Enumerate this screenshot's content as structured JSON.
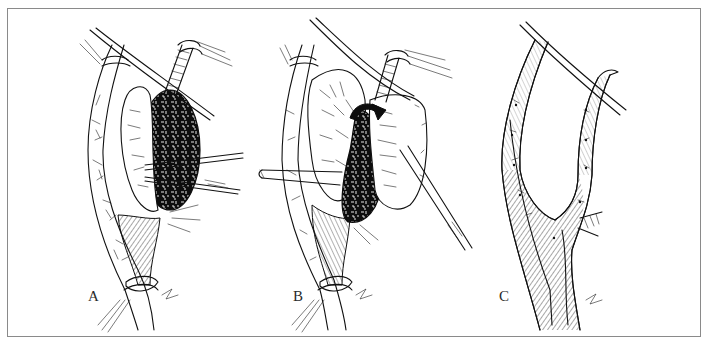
{
  "figure": {
    "type": "surgical-illustration",
    "style": "black-and-white line art",
    "frame_color": "#8a8a8a",
    "ink_color": "#111111",
    "background_color": "#ffffff"
  },
  "panels": [
    {
      "id": "A",
      "label": "A",
      "depicts": "Vessel with open aneurysmal sac; dark thrombus being removed with forceps; proximal and distal vessel loops/ties"
    },
    {
      "id": "B",
      "label": "B",
      "depicts": "Sac wall being reflected with curved arrow indicating direction; forceps and catheter/probe inserted; vessel loops around branches"
    },
    {
      "id": "C",
      "label": "C",
      "depicts": "Completed repair showing bifurcating vessel reconstructed with sutures; vessel loop crossing upper branches"
    }
  ]
}
